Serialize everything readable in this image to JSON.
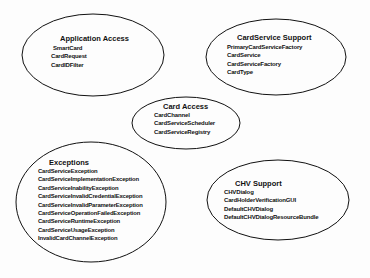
{
  "diagram": {
    "groups": [
      {
        "id": "application-access",
        "title": "Application  Access",
        "items": [
          "SmartCard",
          "CardRequest",
          "CardIDFilter"
        ]
      },
      {
        "id": "cardservice-support",
        "title": "CardService Support",
        "items": [
          "PrimaryCardServiceFactory",
          "CardService",
          "CardServiceFactory",
          "CardType"
        ]
      },
      {
        "id": "card-access",
        "title": "Card Access",
        "items": [
          "CardChannel",
          "CardServiceScheduler",
          "CardServiceRegistry"
        ]
      },
      {
        "id": "exceptions",
        "title": "Exceptions",
        "items": [
          "CardServiceException",
          "CardServiceImplementationException",
          "CardServiceInabilityException",
          "CardServiceInvalidCredentialException",
          "CardServiceInvalidParameterException",
          "CardServiceOperationFailedException",
          "CardServiceRuntimeException",
          "CardServiceUsageException",
          "InvalidCardChannelException"
        ]
      },
      {
        "id": "chv-support",
        "title": "CHV Support",
        "items": [
          "CHVDialog",
          "CardHolderVerificationGUI",
          "DefaultCHVDialog",
          "DefaultCHVDialogResourceBundle"
        ]
      }
    ],
    "colors": {
      "stroke": "#111111",
      "text": "#111111",
      "background": "#fdfdfd"
    }
  }
}
